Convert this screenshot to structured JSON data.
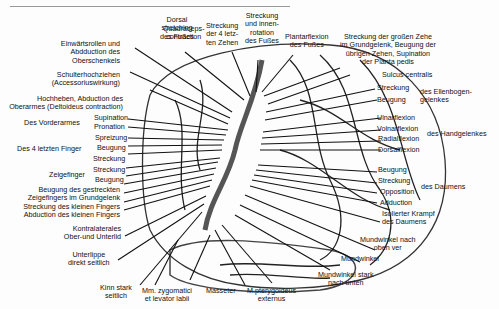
{
  "labels": {
    "top": [
      {
        "id": "dorsal",
        "text": "Dorsal\nstretching\ndes Fußes"
      },
      {
        "id": "quad",
        "text": "Quadraceps-\ncontraction"
      },
      {
        "id": "zehen4",
        "text": "Streckung\nder 4 letz-\nten Zehen"
      },
      {
        "id": "innen",
        "text": "Streckung\nund innen-\nrotation\ndes Fußes"
      },
      {
        "id": "plantar",
        "text": "Plantarflexion\ndes Fußes"
      },
      {
        "id": "grosse",
        "text": "Streckung der großen Zehe\nim Grundgelenk, Beugung der\nübrigen Zehen, Supination\nder Planta pedis"
      }
    ],
    "left": [
      {
        "id": "einw",
        "text": "Einwärtsrollen und\nAbdduction des\nOberschenkels"
      },
      {
        "id": "schulter",
        "text": "Schulterhochziehen\n(Accessoriuswirkung)"
      },
      {
        "id": "hoch",
        "text": "Hochheben, Abduction des\nOberarmes (Deltoideus contraction)"
      },
      {
        "id": "vorder",
        "text": "Des Vorderarmes"
      },
      {
        "id": "sup",
        "text": "Supination"
      },
      {
        "id": "pro",
        "text": "Pronation"
      },
      {
        "id": "finger4",
        "text": "Des 4 letzten Finger"
      },
      {
        "id": "spreiz",
        "text": "Spreizung"
      },
      {
        "id": "beug1",
        "text": "Beugung"
      },
      {
        "id": "streck1",
        "text": "Streckung"
      },
      {
        "id": "zeige",
        "text": "Zeigefinger"
      },
      {
        "id": "streck2",
        "text": "Streckung"
      },
      {
        "id": "beug2",
        "text": "Beugung"
      },
      {
        "id": "gestreckt",
        "text": "Beugung des gestreckten\nZeigefingers im Grundgelenk\nStreckung des kleinen Fingers\nAbduction des kleinen Fingers"
      },
      {
        "id": "kontra",
        "text": "Kontralaterales\nOber-und Unterlid"
      },
      {
        "id": "unterlippe",
        "text": "Unterlippe\ndirekt seitlich"
      }
    ],
    "bottom": [
      {
        "id": "kinn",
        "text": "Kinn stark\nseitlich"
      },
      {
        "id": "zygo",
        "text": "Mm. zygomatici\net levator labii"
      },
      {
        "id": "masseter",
        "text": "Masseter"
      },
      {
        "id": "ptery",
        "text": "M.pterygoideus\nexternus"
      },
      {
        "id": "mstark",
        "text": "Mundwinkel stark\nnach unten"
      }
    ],
    "right": [
      {
        "id": "sulcus",
        "text": "Sulcus centralis"
      },
      {
        "id": "streckE",
        "text": "Streckung"
      },
      {
        "id": "beugE",
        "text": "Beugung"
      },
      {
        "id": "ellen",
        "text": "des Ellenbogen-\ngelenkes"
      },
      {
        "id": "ulnar",
        "text": "Ulnarflexion"
      },
      {
        "id": "volar",
        "text": "Volnarflexion"
      },
      {
        "id": "radial",
        "text": "Radialflexion"
      },
      {
        "id": "dorsalf",
        "text": "Dorsalflexion"
      },
      {
        "id": "hand",
        "text": "des Handgelenkes"
      },
      {
        "id": "beugD",
        "text": "Beugung"
      },
      {
        "id": "streckD",
        "text": "Streckung"
      },
      {
        "id": "oppo",
        "text": "Opposition"
      },
      {
        "id": "addu",
        "text": "Adduction"
      },
      {
        "id": "daumen",
        "text": "des Daumens"
      },
      {
        "id": "isol",
        "text": "Isolierter Krampf\ndes Daumens"
      },
      {
        "id": "moben",
        "text": "Mundwinkel nach\noben ver"
      },
      {
        "id": "mwinkel",
        "text": "Mundwinkel"
      }
    ]
  }
}
